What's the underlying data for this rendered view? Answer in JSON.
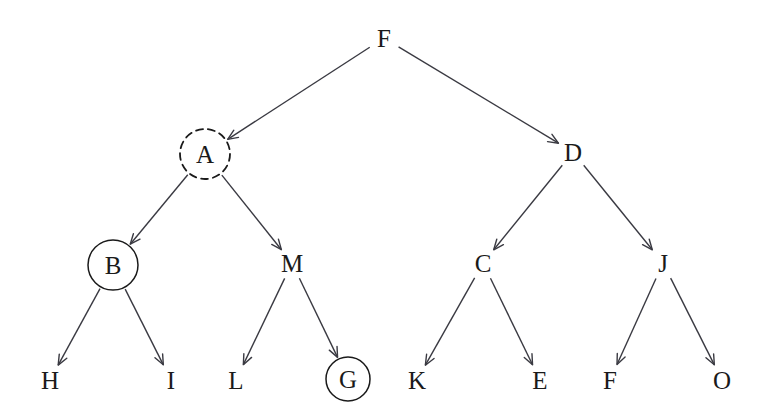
{
  "diagram": {
    "type": "directed-tree",
    "background_color": "#ffffff",
    "stroke_color": "#3a3a42",
    "text_color": "#1a1a1a"
  },
  "nodes": [
    {
      "id": "F",
      "label": "F",
      "x": 384,
      "y": 38,
      "marker": "none",
      "radius": 0
    },
    {
      "id": "A",
      "label": "A",
      "x": 205,
      "y": 154,
      "marker": "dashed",
      "radius": 25
    },
    {
      "id": "D",
      "label": "D",
      "x": 573,
      "y": 152,
      "marker": "none",
      "radius": 0
    },
    {
      "id": "B",
      "label": "B",
      "x": 113,
      "y": 265,
      "marker": "solid",
      "radius": 25
    },
    {
      "id": "M",
      "label": "M",
      "x": 292,
      "y": 263,
      "marker": "none",
      "radius": 0
    },
    {
      "id": "C",
      "label": "C",
      "x": 483,
      "y": 263,
      "marker": "none",
      "radius": 0
    },
    {
      "id": "J",
      "label": "J",
      "x": 663,
      "y": 263,
      "marker": "none",
      "radius": 0
    },
    {
      "id": "H",
      "label": "H",
      "x": 50,
      "y": 380,
      "marker": "none",
      "radius": 0
    },
    {
      "id": "I",
      "label": "I",
      "x": 171,
      "y": 380,
      "marker": "none",
      "radius": 0
    },
    {
      "id": "L",
      "label": "L",
      "x": 236,
      "y": 380,
      "marker": "none",
      "radius": 0
    },
    {
      "id": "G",
      "label": "G",
      "x": 348,
      "y": 379,
      "marker": "solid",
      "radius": 22
    },
    {
      "id": "K",
      "label": "K",
      "x": 417,
      "y": 380,
      "marker": "none",
      "radius": 0
    },
    {
      "id": "E",
      "label": "E",
      "x": 540,
      "y": 380,
      "marker": "none",
      "radius": 0
    },
    {
      "id": "F2",
      "label": "F",
      "x": 610,
      "y": 380,
      "marker": "none",
      "radius": 0
    },
    {
      "id": "O",
      "label": "O",
      "x": 722,
      "y": 380,
      "marker": "none",
      "radius": 0
    }
  ],
  "edges": [
    {
      "from": "F",
      "to": "A",
      "arrow": true
    },
    {
      "from": "F",
      "to": "D",
      "arrow": true
    },
    {
      "from": "A",
      "to": "B",
      "arrow": true
    },
    {
      "from": "A",
      "to": "M",
      "arrow": true
    },
    {
      "from": "D",
      "to": "C",
      "arrow": true
    },
    {
      "from": "D",
      "to": "J",
      "arrow": true
    },
    {
      "from": "B",
      "to": "H",
      "arrow": true
    },
    {
      "from": "B",
      "to": "I",
      "arrow": true
    },
    {
      "from": "M",
      "to": "L",
      "arrow": true
    },
    {
      "from": "M",
      "to": "G",
      "arrow": true
    },
    {
      "from": "C",
      "to": "K",
      "arrow": true
    },
    {
      "from": "C",
      "to": "E",
      "arrow": true
    },
    {
      "from": "J",
      "to": "F2",
      "arrow": true
    },
    {
      "from": "J",
      "to": "O",
      "arrow": true
    }
  ]
}
